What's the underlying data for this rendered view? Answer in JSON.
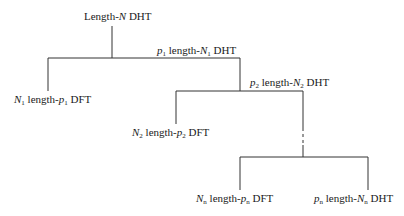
{
  "diagram": {
    "type": "tree",
    "nodes": [
      {
        "id": "root",
        "pre": "Length-",
        "var": "N",
        "sub": "",
        "post": " DHT"
      },
      {
        "id": "dht1",
        "coef": "p",
        "coef_sub": "1",
        "pre": " length-",
        "var": "N",
        "sub": "1",
        "post": " DHT"
      },
      {
        "id": "dft1",
        "coef": "N",
        "coef_sub": "1",
        "pre": " length-",
        "var": "p",
        "sub": "1",
        "post": " DFT"
      },
      {
        "id": "dht2",
        "coef": "p",
        "coef_sub": "2",
        "pre": " length-",
        "var": "N",
        "sub": "2",
        "post": " DHT"
      },
      {
        "id": "dft2",
        "coef": "N",
        "coef_sub": "2",
        "pre": " length-",
        "var": "p",
        "sub": "2",
        "post": " DFT"
      },
      {
        "id": "dftn",
        "coef": "N",
        "coef_sub": "n",
        "pre": " length-",
        "var": "p",
        "sub": "n",
        "post": " DFT"
      },
      {
        "id": "dhtn",
        "coef": "p",
        "coef_sub": "n",
        "pre": " length-",
        "var": "N",
        "sub": "n",
        "post": " DHT"
      }
    ],
    "edges": [
      {
        "from": "root",
        "to": "dft1"
      },
      {
        "from": "root",
        "to": "dht1"
      },
      {
        "from": "dht1",
        "to": "dft2"
      },
      {
        "from": "dht1",
        "to": "dht2"
      },
      {
        "from": "dht2",
        "to": "dftn",
        "style": "dashed-ellipsis"
      },
      {
        "from": "dht2",
        "to": "dhtn",
        "style": "dashed-ellipsis"
      }
    ],
    "line_color": "#333333"
  }
}
